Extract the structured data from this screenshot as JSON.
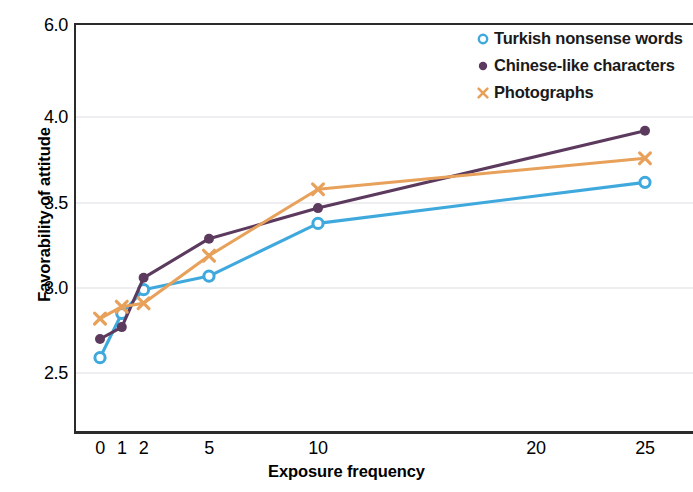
{
  "chart_data": {
    "type": "line",
    "title": "",
    "xlabel": "Exposure frequency",
    "ylabel": "Favorability of attitude",
    "x": [
      0,
      1,
      2,
      5,
      10,
      25
    ],
    "xticks": [
      "0",
      "1",
      "2",
      "5",
      "10",
      "20",
      "25"
    ],
    "xtick_values": [
      0,
      1,
      2,
      5,
      10,
      20,
      25
    ],
    "yticks": [
      "6.0",
      "4.0",
      "3.5",
      "3.0",
      "2.5"
    ],
    "ytick_values": [
      6.0,
      4.0,
      3.5,
      3.0,
      2.5
    ],
    "xlim": [
      -1,
      27.4
    ],
    "ylim": [
      2.3,
      6.0
    ],
    "grid": true,
    "legend_position": "top-right",
    "series": [
      {
        "name": "Turkish nonsense words",
        "marker": "open-circle",
        "color": "#3fa9dd",
        "values": [
          2.59,
          2.85,
          2.99,
          3.07,
          3.38,
          3.62
        ]
      },
      {
        "name": "Chinese-like characters",
        "marker": "filled-circle",
        "color": "#5c3a5e",
        "values": [
          2.7,
          2.77,
          3.06,
          3.29,
          3.47,
          3.92
        ]
      },
      {
        "name": "Photographs",
        "marker": "x",
        "color": "#e8a15a",
        "values": [
          2.82,
          2.89,
          2.91,
          3.19,
          3.58,
          3.76
        ]
      }
    ]
  },
  "axis": {
    "ylabel": "Favorability of attitude",
    "xlabel": "Exposure frequency",
    "yticks": [
      "6.0",
      "4.0",
      "3.5",
      "3.0",
      "2.5"
    ],
    "xticks": [
      "0",
      "1",
      "2",
      "5",
      "10",
      "20",
      "25"
    ]
  },
  "legend": {
    "items": [
      {
        "label": "Turkish nonsense words",
        "marker": "open-circle-icon",
        "color": "#3fa9dd"
      },
      {
        "label": "Chinese-like characters",
        "marker": "filled-circle-icon",
        "color": "#5c3a5e"
      },
      {
        "label": "Photographs",
        "marker": "cross-x-icon",
        "color": "#e8a15a"
      }
    ]
  }
}
